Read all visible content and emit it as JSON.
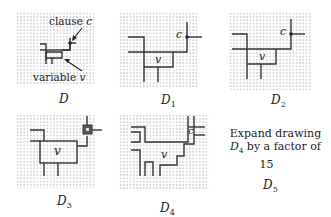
{
  "figure": {
    "panels": [
      {
        "id": "D",
        "label": "D",
        "subscript": "",
        "annotations": {
          "clause": "clause",
          "clause_var": "c",
          "variable": "variable",
          "variable_var": "v"
        }
      },
      {
        "id": "D1",
        "label": "D",
        "subscript": "1",
        "node_labels": {
          "clause": "c",
          "variable": "v"
        }
      },
      {
        "id": "D2",
        "label": "D",
        "subscript": "2",
        "node_labels": {
          "clause": "c",
          "variable": "v"
        }
      },
      {
        "id": "D3",
        "label": "D",
        "subscript": "3",
        "node_labels": {
          "variable": "v"
        }
      },
      {
        "id": "D4",
        "label": "D",
        "subscript": "4",
        "node_labels": {
          "clause": "c",
          "variable": "v"
        }
      },
      {
        "id": "D5",
        "label": "D",
        "subscript": "5",
        "caption_line1": "Expand drawing",
        "caption_line2_var": "D",
        "caption_line2_sub": "4",
        "caption_line2_rest": " by a factor of",
        "caption_line3": "15"
      }
    ]
  },
  "colors": {
    "line": "#333333",
    "grid_dot": "#c8c8c8",
    "background": "#ffffff"
  }
}
